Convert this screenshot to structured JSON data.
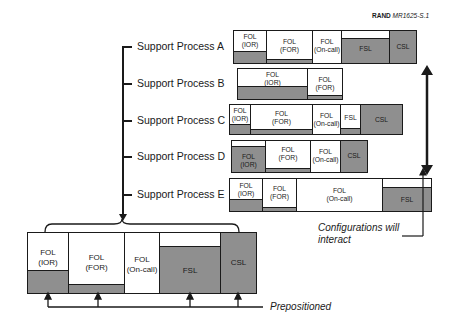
{
  "reference": {
    "org": "RAND",
    "code": "MR1625-S.1"
  },
  "processes": [
    {
      "label": "Support Process A"
    },
    {
      "label": "Support Process B"
    },
    {
      "label": "Support Process C"
    },
    {
      "label": "Support Process D"
    },
    {
      "label": "Support Process E"
    }
  ],
  "segments": {
    "ior": "FOL\n(IOR)",
    "for": "FOL\n(FOR)",
    "oncall": "FOL\n(On-call)",
    "fsl": "FSL",
    "csl": "CSL"
  },
  "annotations": {
    "interact": "Configurations will\ninteract",
    "interact_line1": "Configurations will",
    "interact_line2": "interact",
    "prepositioned": "Prepositioned"
  },
  "colors": {
    "fill": "#8f8f8f",
    "line": "#1a1a1a",
    "background": "#ffffff"
  }
}
